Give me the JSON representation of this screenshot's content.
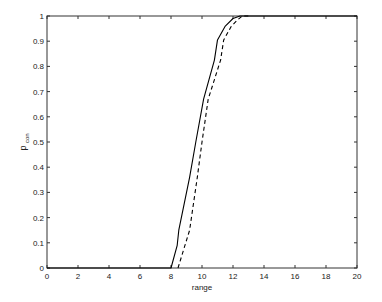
{
  "chart_data": {
    "type": "line",
    "title": "",
    "xlabel": "range",
    "ylabel": "p",
    "ylabel_subscript": "con",
    "xlim": [
      0,
      20
    ],
    "ylim": [
      0,
      1
    ],
    "xticks": [
      0,
      2,
      4,
      6,
      8,
      10,
      12,
      14,
      16,
      18,
      20
    ],
    "yticks": [
      0,
      0.1,
      0.2,
      0.3,
      0.4,
      0.5,
      0.6,
      0.7,
      0.8,
      0.9,
      1
    ],
    "xtick_labels": [
      "0",
      "2",
      "4",
      "6",
      "8",
      "10",
      "12",
      "14",
      "16",
      "18",
      "20"
    ],
    "ytick_labels": [
      "0",
      "0.1",
      "0.2",
      "0.3",
      "0.4",
      "0.5",
      "0.6",
      "0.7",
      "0.8",
      "0.9",
      "1"
    ],
    "grid": false,
    "legend": null,
    "series": [
      {
        "name": "solid",
        "style": "solid",
        "color": "#000000",
        "x": [
          0,
          8.0,
          8.4,
          8.5,
          9.2,
          9.6,
          10.1,
          10.8,
          11.0,
          11.5,
          12.0,
          12.45,
          13.0,
          20
        ],
        "y": [
          0,
          0,
          0.09,
          0.15,
          0.36,
          0.5,
          0.67,
          0.825,
          0.905,
          0.96,
          0.99,
          1.0,
          1.0,
          1.0
        ]
      },
      {
        "name": "dashed",
        "style": "dashed",
        "color": "#000000",
        "x": [
          8.45,
          8.8,
          9.2,
          9.7,
          10.0,
          10.4,
          11.2,
          11.4,
          11.9,
          12.3,
          12.6,
          13.0
        ],
        "y": [
          0,
          0.07,
          0.15,
          0.36,
          0.5,
          0.67,
          0.825,
          0.905,
          0.96,
          0.985,
          1.0,
          1.0
        ]
      }
    ]
  },
  "plot_area": {
    "left": 47,
    "top": 16,
    "right": 357,
    "bottom": 268
  },
  "colors": {
    "axis": "#333333",
    "line": "#000000",
    "background": "#ffffff"
  }
}
